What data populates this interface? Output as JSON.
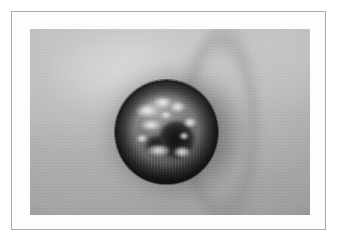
{
  "figure": {
    "kind": "clinical-photograph",
    "modality": "grayscale photograph",
    "caption": "",
    "frame": {
      "border_color": "#a9a9ab",
      "mat_color": "#fdfdfd",
      "border_width_px": 1
    },
    "plate": {
      "x": 18,
      "y": 17,
      "width": 280,
      "height": 186,
      "background_color": "#a8a8a8"
    }
  },
  "subject": {
    "name": "raised-skin-nodule",
    "description": "Dome-shaped nodular skin lesion with dark rolled border, central ulcerated crater and adherent pale keratotic crust, surrounded by smooth skin",
    "surrounding_tissue": "skin",
    "lesion": {
      "shape": "dome-shaped nodule",
      "border": "rolled, sharply demarcated",
      "surface": "crusted with central ulceration",
      "relative_bounds": {
        "left_pct": 30.4,
        "top_pct": 27.4,
        "width_pct": 36.8,
        "height_pct": 55.9
      }
    }
  },
  "palette": {
    "skin_light": "#cfcfcf",
    "skin_mid": "#b3b3b3",
    "skin_dark": "#989898",
    "lesion_highlight": "#8d8d8d",
    "lesion_mid": "#646464",
    "lesion_rim": "#343434",
    "crater_dark": "#101010",
    "crust_light": "#f5f5f5",
    "page_white": "#ffffff"
  }
}
